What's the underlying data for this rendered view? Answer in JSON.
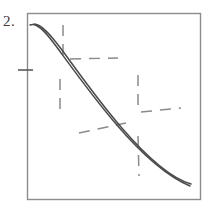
{
  "figure": {
    "item_number": "2.",
    "kind": "hand-drawn-graph",
    "colors": {
      "ink": "#4a4a4a",
      "frame": "#8c8c8c",
      "dashed": "#8a8a8a",
      "background": "#ffffff"
    },
    "frame": {
      "x": 27,
      "y": 13,
      "width": 173,
      "height": 186
    },
    "axis_tick": {
      "name": "left-axis-tick",
      "x1": 18,
      "y1": 70,
      "x2": 33,
      "y2": 70
    },
    "curve": {
      "name": "decreasing-curve",
      "outline_a": "M 30 25 C 36 22 44 30 56 46 C 70 65 92 96 116 124 C 140 152 166 176 190 186",
      "outline_b": "M 34 24 C 41 24 50 34 62 50 C 76 69 97 99 121 127 C 145 155 170 178 191 184"
    },
    "dashed_lines": [
      {
        "name": "dash-vertical-upper-left",
        "x1": 63,
        "y1": 25,
        "x2": 63,
        "y2": 56
      },
      {
        "name": "dash-horizontal-upper",
        "x1": 70,
        "y1": 59,
        "x2": 118,
        "y2": 58
      },
      {
        "name": "dash-vertical-mid-left",
        "x1": 60,
        "y1": 79,
        "x2": 60,
        "y2": 110
      },
      {
        "name": "dash-vertical-mid-right",
        "x1": 138,
        "y1": 75,
        "x2": 138,
        "y2": 108
      },
      {
        "name": "dash-horizontal-right",
        "x1": 141,
        "y1": 112,
        "x2": 181,
        "y2": 108
      },
      {
        "name": "dash-horizontal-lower-left",
        "x1": 79,
        "y1": 133,
        "x2": 126,
        "y2": 123
      },
      {
        "name": "dash-vertical-lower",
        "x1": 138,
        "y1": 136,
        "x2": 139,
        "y2": 176
      }
    ]
  }
}
